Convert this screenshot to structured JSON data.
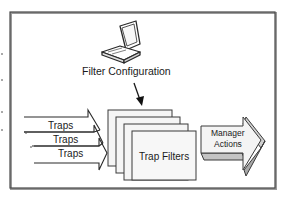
{
  "diagram": {
    "config_label": "Filter Configuration",
    "traps": [
      {
        "label": "Traps"
      },
      {
        "label": "Traps"
      },
      {
        "label": "Traps"
      }
    ],
    "filters_label": "Trap Filters",
    "manager": {
      "line1": "Manager",
      "line2": "Actions"
    },
    "colors": {
      "frame": "#5a5a5a",
      "frame_shadow": "#9a9a9a",
      "stroke": "#2a2a2a",
      "page_fill": "#f4f4f4",
      "arrow_face": "#f2f2f2",
      "arrow_side": "#b8b8b8",
      "arrow_bottom": "#c8c8c8"
    }
  }
}
